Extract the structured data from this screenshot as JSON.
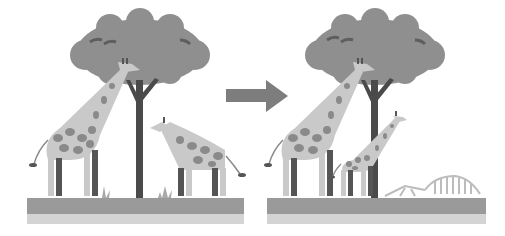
{
  "figure": {
    "colors": {
      "background": "#ffffff",
      "canopy": "#8f8f8f",
      "canopy_mark": "#5e5e5e",
      "trunk": "#4a4a4a",
      "giraffe_body": "#c9c9c9",
      "giraffe_spot": "#8a8a8a",
      "giraffe_leg_dark": "#555555",
      "ground": "#9a9a9a",
      "ground_speckle": "#bdbdbd",
      "arrow": "#7d7d7d",
      "skeleton": "#bcbcbc",
      "grass": "#a8a8a8"
    },
    "panels": [
      {
        "name": "before",
        "elements": [
          "tree",
          "tall-giraffe-eating",
          "short-giraffe",
          "grass-tufts",
          "ground"
        ]
      },
      {
        "name": "after",
        "elements": [
          "tree",
          "tall-giraffe-eating",
          "young-tall-giraffe",
          "giraffe-skeleton",
          "ground"
        ]
      }
    ],
    "arrow_label": ""
  }
}
